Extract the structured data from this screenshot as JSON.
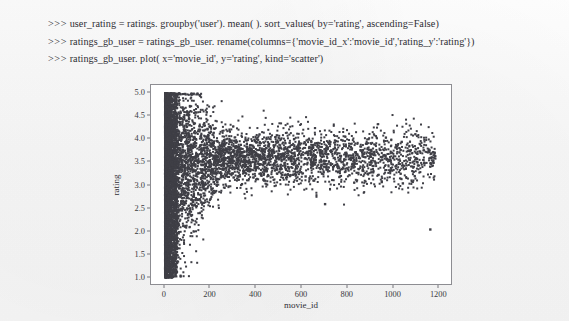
{
  "console": {
    "lines": [
      {
        "prompt": ">>>",
        "code": "user_rating = ratings. groupby('user'). mean( ). sort_values( by='rating', ascending=False)"
      },
      {
        "prompt": ">>>",
        "code": "ratings_gb_user = ratings_gb_user. rename(columns={'movie_id_x':'movie_id','rating_y':'rating'})"
      },
      {
        "prompt": ">>>",
        "code": "ratings_gb_user. plot( x='movie_id', y='rating', kind='scatter')"
      }
    ]
  },
  "chart_data": {
    "type": "scatter",
    "title": "",
    "xlabel": "movie_id",
    "ylabel": "rating",
    "xlim": [
      -60,
      1260
    ],
    "ylim": [
      0.82,
      5.18
    ],
    "xticks": [
      0,
      200,
      400,
      600,
      800,
      1000,
      1200
    ],
    "xtick_labels": [
      "0",
      "200",
      "400",
      "600",
      "800",
      "1000",
      "1200"
    ],
    "yticks": [
      1.0,
      1.5,
      2.0,
      2.5,
      3.0,
      3.5,
      4.0,
      4.5,
      5.0
    ],
    "ytick_labels": [
      "1.0",
      "1.5",
      "2.0",
      "2.5",
      "3.0",
      "3.5",
      "4.0",
      "4.5",
      "5.0"
    ],
    "grid": false,
    "legend": false,
    "marker_color": "#3f3f46",
    "marker_size": 2.0,
    "point_count_approx": 6040,
    "density_profile": {
      "core_band_x_range": [
        1,
        55
      ],
      "core_band_y_range": [
        1.0,
        5.0
      ],
      "fan_x_range": [
        55,
        450
      ],
      "fan_y_center": 3.55,
      "tail_x_range": [
        450,
        1180
      ],
      "tail_y_range": [
        2.0,
        4.4
      ]
    },
    "notable_outliers": [
      {
        "x": 1160,
        "y": 2.05
      },
      {
        "x": 1035,
        "y": 3.95
      },
      {
        "x": 1040,
        "y": 3.05
      },
      {
        "x": 865,
        "y": 3.35
      },
      {
        "x": 835,
        "y": 3.7
      },
      {
        "x": 760,
        "y": 3.55
      },
      {
        "x": 700,
        "y": 2.6
      },
      {
        "x": 640,
        "y": 3.95
      },
      {
        "x": 615,
        "y": 3.2
      }
    ]
  }
}
